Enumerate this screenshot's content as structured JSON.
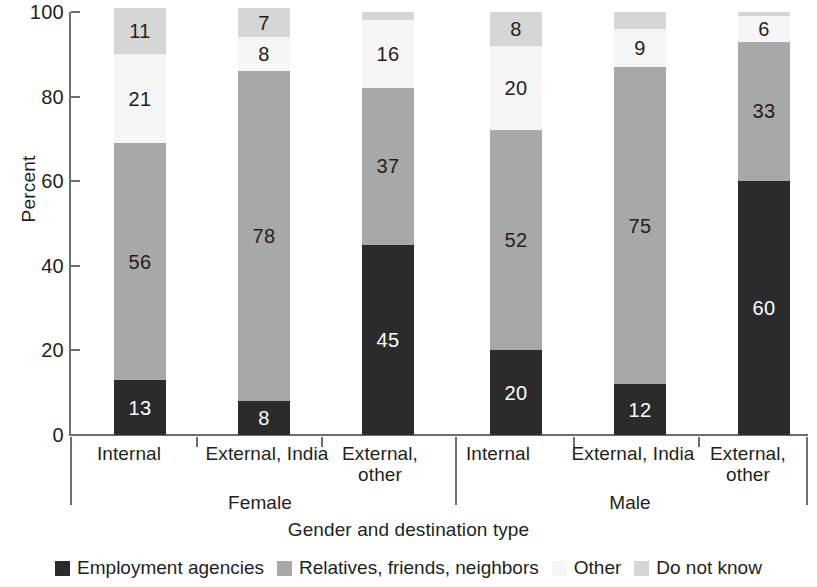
{
  "chart_data": {
    "type": "bar",
    "title": "",
    "subtitle": "",
    "stacked": true,
    "orientation": "vertical",
    "xlabel": "Gender and destination type",
    "ylabel": "Percent",
    "ylim": [
      0,
      100
    ],
    "yticks": [
      0,
      20,
      40,
      60,
      80,
      100
    ],
    "grid": false,
    "legend_position": "bottom",
    "categories": [
      "Internal",
      "External, India",
      "External, other",
      "Internal",
      "External, India",
      "External, other"
    ],
    "groups": [
      {
        "name": "Female",
        "categories": [
          "Internal",
          "External, India",
          "External, other"
        ]
      },
      {
        "name": "Male",
        "categories": [
          "Internal",
          "External, India",
          "External, other"
        ]
      }
    ],
    "series": [
      {
        "name": "Employment agencies",
        "color": "#2b2b2b",
        "values": [
          13,
          8,
          45,
          20,
          12,
          60
        ]
      },
      {
        "name": "Relatives, friends, neighbors",
        "color": "#a8a8a8",
        "values": [
          56,
          78,
          37,
          52,
          75,
          33
        ]
      },
      {
        "name": "Other",
        "color": "#f6f6f6",
        "values": [
          21,
          8,
          16,
          20,
          9,
          6
        ]
      },
      {
        "name": "Do not know",
        "color": "#d6d6d6",
        "values": [
          11,
          7,
          2,
          8,
          4,
          1
        ]
      }
    ],
    "data_labels": [
      {
        "category": "Female / Internal",
        "Employment agencies": "13",
        "Relatives, friends, neighbors": "56",
        "Other": "21",
        "Do not know": "11"
      },
      {
        "category": "Female / External, India",
        "Employment agencies": "8",
        "Relatives, friends, neighbors": "78",
        "Other": "8",
        "Do not know": "7"
      },
      {
        "category": "Female / External, other",
        "Employment agencies": "45",
        "Relatives, friends, neighbors": "37",
        "Other": "16",
        "Do not know": ""
      },
      {
        "category": "Male / Internal",
        "Employment agencies": "20",
        "Relatives, friends, neighbors": "52",
        "Other": "20",
        "Do not know": "8"
      },
      {
        "category": "Male / External, India",
        "Employment agencies": "12",
        "Relatives, friends, neighbors": "75",
        "Other": "9",
        "Do not know": ""
      },
      {
        "category": "Male / External, other",
        "Employment agencies": "60",
        "Relatives, friends, neighbors": "33",
        "Other": "6",
        "Do not know": ""
      }
    ]
  },
  "axis": {
    "y": {
      "label": "Percent",
      "ticks": [
        "100",
        "80",
        "60",
        "40",
        "20",
        "0"
      ]
    },
    "x": {
      "title": "Gender and destination type",
      "cat0": "Internal",
      "cat1": "External, India",
      "cat2_line1": "External,",
      "cat2_line2": "other",
      "cat3": "Internal",
      "cat4": "External, India",
      "cat5_line1": "External,",
      "cat5_line2": "other",
      "group0": "Female",
      "group1": "Male"
    }
  },
  "bars": [
    {
      "id": "female-internal",
      "labels": [
        "13",
        "56",
        "21",
        "11"
      ]
    },
    {
      "id": "female-external-india",
      "labels": [
        "8",
        "78",
        "8",
        "7"
      ]
    },
    {
      "id": "female-external-other",
      "labels": [
        "45",
        "37",
        "16",
        ""
      ]
    },
    {
      "id": "male-internal",
      "labels": [
        "20",
        "52",
        "20",
        "8"
      ]
    },
    {
      "id": "male-external-india",
      "labels": [
        "12",
        "75",
        "9",
        ""
      ]
    },
    {
      "id": "male-external-other",
      "labels": [
        "60",
        "33",
        "6",
        ""
      ]
    }
  ],
  "legend": {
    "items": [
      {
        "label": "Employment agencies",
        "color": "#2b2b2b"
      },
      {
        "label": "Relatives, friends, neighbors",
        "color": "#a8a8a8"
      },
      {
        "label": "Other",
        "color": "#f6f6f6"
      },
      {
        "label": "Do not know",
        "color": "#d6d6d6"
      }
    ]
  }
}
